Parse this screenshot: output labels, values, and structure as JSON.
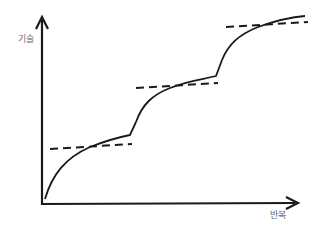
{
  "diagram": {
    "title": "",
    "y_axis_label": "기술",
    "x_axis_label": "반복",
    "stages": [
      {
        "name": "stage-1",
        "curve": "M45,199 C55,170 70,155 95,145 C110,139 120,137 130,135 L136,122",
        "plateau": [
          50,
          149,
          132,
          144
        ]
      },
      {
        "name": "stage-2",
        "curve": "M136,122 C145,100 160,90 185,83 C200,79 210,78 216,76 L222,60",
        "plateau": [
          136,
          88,
          218,
          83
        ]
      },
      {
        "name": "stage-3",
        "curve": "M222,60 C230,40 245,32 265,25 C280,20 295,17 305,16",
        "plateau": [
          226,
          27,
          308,
          22
        ]
      }
    ],
    "colors": {
      "line": "#1a1a1a",
      "label": "#6b6b6b"
    }
  }
}
